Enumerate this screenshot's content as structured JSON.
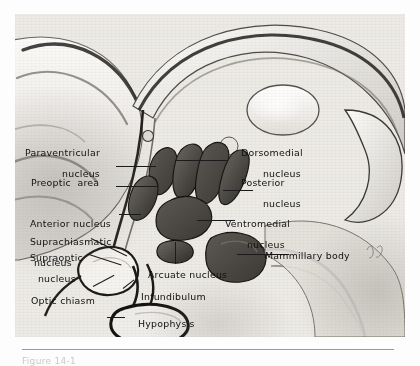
{
  "figure": {
    "caption_fragment": "Figure 14-1",
    "labels_left": [
      {
        "id": "paraventricular-nucleus",
        "line1": "Paraventricular",
        "line2": "nucleus"
      },
      {
        "id": "preoptic-area",
        "line1": "Preoptic  area",
        "line2": ""
      },
      {
        "id": "anterior-nucleus",
        "line1": "Anterior nucleus",
        "line2": ""
      },
      {
        "id": "suprachiasmatic-nucleus",
        "line1": "Suprachiasmatic",
        "line2": "nucleus"
      },
      {
        "id": "supraoptic-nucleus",
        "line1": "Supraoptic",
        "line2": "nucleus"
      },
      {
        "id": "optic-chiasm",
        "line1": "Optic chiasm",
        "line2": ""
      }
    ],
    "labels_right": [
      {
        "id": "dorsomedial-nucleus",
        "line1": "Dorsomedial",
        "line2": "nucleus"
      },
      {
        "id": "posterior-nucleus",
        "line1": "Posterior",
        "line2": "nucleus"
      },
      {
        "id": "ventromedial-nucleus",
        "line1": "Ventromedial",
        "line2": "nucleus"
      },
      {
        "id": "mammillary-body",
        "line1": "Mammillary body",
        "line2": ""
      }
    ],
    "labels_center": [
      {
        "id": "arcuate-nucleus",
        "line1": "Arcuate nucleus",
        "line2": ""
      },
      {
        "id": "infundibulum",
        "line1": "Infundibulum",
        "line2": ""
      },
      {
        "id": "hypophysis",
        "line1": "Hypophysis",
        "line2": ""
      }
    ],
    "colors": {
      "ink": "#111111",
      "leader": "#1b1b1b",
      "paper": "#e8e6e1",
      "nucleus_dark": "#3a3732",
      "rule": "#9a9a9a"
    }
  }
}
